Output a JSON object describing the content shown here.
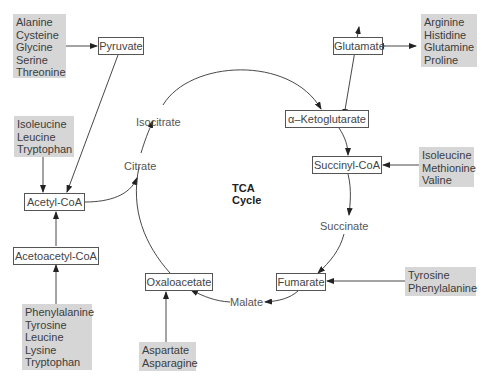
{
  "title": {
    "line1": "TCA",
    "line2": "Cycle"
  },
  "cycle_nodes": {
    "pyruvate": "Pyruvate",
    "acetyl_coa": "Acetyl-CoA",
    "acetoacetyl_coa": "Acetoacetyl-CoA",
    "citrate": "Citrate",
    "isocitrate": "Isocitrate",
    "alpha_ketoglutarate": "α–Ketoglutarate",
    "glutamate": "Glutamate",
    "succinyl_coa": "Succinyl-CoA",
    "succinate": "Succinate",
    "fumarate": "Fumarate",
    "malate": "Malate",
    "oxaloacetate": "Oxaloacetate"
  },
  "amino_acid_groups": {
    "to_pyruvate": [
      "Alanine",
      "Cysteine",
      "Glycine",
      "Serine",
      "Threonine"
    ],
    "to_glutamate": [
      "Arginine",
      "Histidine",
      "Glutamine",
      "Proline"
    ],
    "to_acetyl_coa": [
      "Isoleucine",
      "Leucine",
      "Tryptophan"
    ],
    "to_succinyl_coa": [
      "Isoleucine",
      "Methionine",
      "Valine"
    ],
    "to_acetoacetyl_coa": [
      "Phenylalanine",
      "Tyrosine",
      "Leucine",
      "Lysine",
      "Tryptophan"
    ],
    "to_fumarate": [
      "Tyrosine",
      "Phenylalanine"
    ],
    "to_oxaloacetate": [
      "Aspartate",
      "Asparagine"
    ]
  },
  "colors": {
    "group_fill": "#d6d6d6",
    "line": "#333333",
    "box_border": "#555555"
  }
}
